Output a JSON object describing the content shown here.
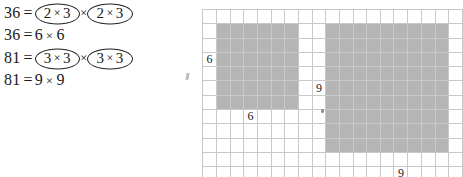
{
  "math": {
    "groups": [
      {
        "id": "36",
        "line1": {
          "number": "36",
          "equals": "=",
          "factor_left": {
            "a": "2",
            "op": "×",
            "b": "3"
          },
          "times": "×",
          "factor_right": {
            "a": "2",
            "op": "×",
            "b": "3"
          }
        },
        "line2": {
          "number": "36",
          "equals": "=",
          "a": "6",
          "op": "×",
          "b": "6"
        }
      },
      {
        "id": "81",
        "line1": {
          "number": "81",
          "equals": "=",
          "factor_left": {
            "a": "3",
            "op": "×",
            "b": "3"
          },
          "times": "×",
          "factor_right": {
            "a": "3",
            "op": "×",
            "b": "3"
          }
        },
        "line2": {
          "number": "81",
          "equals": "=",
          "a": "9",
          "op": "×",
          "b": "9"
        }
      }
    ]
  },
  "grid": {
    "columns": 19,
    "rows": 12,
    "cell_size_px": 13.3,
    "grid_line_color": "#c9c9c9",
    "shade_color": "#b5b5b5",
    "squares": [
      {
        "name": "six-by-six-square",
        "label": "6",
        "side": 6,
        "col_start": 1,
        "row_start": 1,
        "side_label_cell": {
          "row": 3,
          "col": 0,
          "text": "6"
        },
        "bottom_label_cell": {
          "row": 7,
          "col": 3,
          "text": "6"
        }
      },
      {
        "name": "nine-by-nine-square",
        "label": "9",
        "side": 9,
        "col_start": 9,
        "row_start": 1,
        "side_label_cell": {
          "row": 5,
          "col": 8,
          "text": "9"
        },
        "bottom_label_cell": {
          "row": 11,
          "col": 14,
          "text": "9"
        }
      }
    ],
    "labels": [
      {
        "text": "6",
        "row": 3,
        "col": 0
      },
      {
        "text": "6",
        "row": 7,
        "col": 3
      },
      {
        "text": "9",
        "row": 5,
        "col": 8
      },
      {
        "text": "9",
        "row": 11,
        "col": 14
      }
    ]
  }
}
